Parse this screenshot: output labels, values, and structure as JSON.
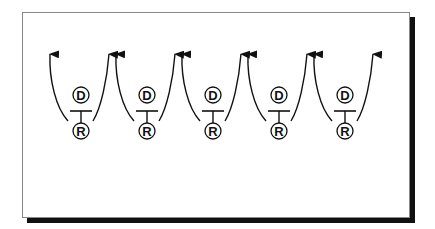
{
  "diagram": {
    "units": [
      {
        "top_label": "D",
        "bottom_label": "R",
        "cx": 81
      },
      {
        "top_label": "D",
        "bottom_label": "R",
        "cx": 147
      },
      {
        "top_label": "D",
        "bottom_label": "R",
        "cx": 213
      },
      {
        "top_label": "D",
        "bottom_label": "R",
        "cx": 279
      },
      {
        "top_label": "D",
        "bottom_label": "R",
        "cx": 345
      }
    ],
    "colors": {
      "line": "#111111",
      "background": "#ffffff",
      "shadow": "#111111"
    }
  }
}
